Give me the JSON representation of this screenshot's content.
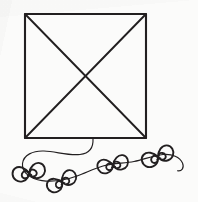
{
  "image": {
    "title": "Hand-drawn kite sketch",
    "subject": "kite",
    "style": "pen-on-paper line drawing",
    "width": 198,
    "height": 202,
    "background_color": "#fbfbfa",
    "ink_color": "#221f20"
  },
  "drawing": {
    "kite_body": {
      "name": "square kite sail",
      "shape": "square",
      "corners": {
        "top_left": [
          25,
          14
        ],
        "top_right": [
          146,
          14
        ],
        "bottom_right": [
          146,
          138
        ],
        "bottom_left": [
          25,
          138
        ]
      },
      "stroke_width": 2.1
    },
    "spars": {
      "name": "crossed diagonal spars",
      "shape": "X",
      "lines": [
        {
          "from": [
            25,
            14
          ],
          "to": [
            146,
            138
          ]
        },
        {
          "from": [
            146,
            14
          ],
          "to": [
            25,
            138
          ]
        }
      ],
      "crossing_point": [
        86,
        76
      ],
      "stroke_width": 1.9
    },
    "tail": {
      "name": "wavy kite tail string",
      "attach_point": [
        93,
        138
      ],
      "end_point": [
        182,
        166
      ],
      "stroke_width": 1.15,
      "path": "M 93 138 C 93 150 82 154 62 152 C 40 150 24 156 23 166 C 22 176 36 182 56 180 C 76 178 92 172 104 168 C 118 163 132 161 146 158 C 160 155 174 156 181 163 C 186 168 183 172 178 171"
    },
    "bows": [
      {
        "name": "tail-bow-1",
        "center": [
          29,
          173
        ],
        "rotation": -12,
        "scale": 1.0
      },
      {
        "name": "tail-bow-2",
        "center": [
          62,
          182
        ],
        "rotation": -28,
        "scale": 0.95
      },
      {
        "name": "tail-bow-3",
        "center": [
          113,
          165
        ],
        "rotation": -14,
        "scale": 0.95
      },
      {
        "name": "tail-bow-4",
        "center": [
          158,
          157
        ],
        "rotation": -22,
        "scale": 1.0
      }
    ]
  }
}
